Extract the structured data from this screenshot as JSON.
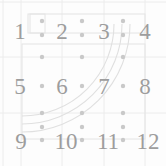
{
  "canvas": {
    "width": 166,
    "height": 166,
    "background": "#fdfdfd",
    "title": "numeric-grid-overlay"
  },
  "palette": {
    "number_color": "#9d9d9d",
    "gridline_color": "#ececec",
    "dot_color": "#c9c9c9",
    "rect_color": "#e4e4e4",
    "arc_color": "#e0e0e0"
  },
  "numbers": {
    "font_size": 23,
    "rows": [
      {
        "row": 0,
        "cy": 31,
        "cells": [
          {
            "label": "1",
            "cx": 20
          },
          {
            "label": "2",
            "cx": 62
          },
          {
            "label": "3",
            "cx": 104
          },
          {
            "label": "4",
            "cx": 145
          }
        ]
      },
      {
        "row": 1,
        "cy": 86,
        "cells": [
          {
            "label": "5",
            "cx": 20
          },
          {
            "label": "6",
            "cx": 62
          },
          {
            "label": "7",
            "cx": 104
          },
          {
            "label": "8",
            "cx": 145
          }
        ]
      },
      {
        "row": 2,
        "cy": 141,
        "cells": [
          {
            "label": "9",
            "cx": 21
          },
          {
            "label": "10",
            "cx": 66
          },
          {
            "label": "11",
            "cx": 108
          },
          {
            "label": "12",
            "cx": 148
          }
        ]
      }
    ]
  },
  "gridlines": {
    "vertical_x": [
      3,
      21,
      62,
      104,
      145
    ],
    "horizontal_y": [
      2,
      57,
      113
    ]
  },
  "dots": {
    "radius": 2.2,
    "xs": [
      42,
      82,
      123
    ],
    "ys": [
      21,
      35,
      57,
      86,
      113,
      127,
      140
    ]
  },
  "rectangles": [
    {
      "name": "outer-band",
      "x": 30,
      "y": 14,
      "w": 115,
      "h": 19
    },
    {
      "name": "left-box",
      "x": 28,
      "y": 14,
      "w": 17,
      "h": 19
    },
    {
      "name": "lower-band",
      "x": 22,
      "y": 44,
      "w": 123,
      "h": 95
    }
  ],
  "arcs": {
    "center_x": 22,
    "center_y": 24,
    "radii": [
      92,
      100,
      108
    ],
    "stroke_width": 1.1
  }
}
